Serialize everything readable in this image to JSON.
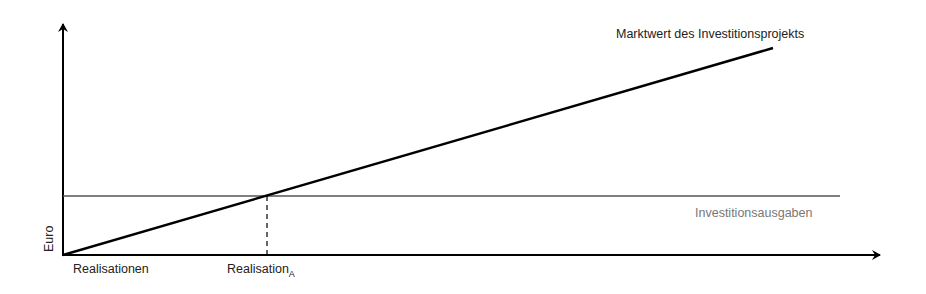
{
  "diagram": {
    "y_axis_label": "Euro",
    "x_axis_labels": {
      "origin": "Realisationen",
      "crossing_main": "Realisation",
      "crossing_sub": "A"
    },
    "lines": {
      "market_value": {
        "label": "Marktwert des Investitionsprojekts",
        "color": "#000000",
        "style": "solid"
      },
      "investment": {
        "label": "Investitionsausgaben",
        "color": "#555555",
        "style": "solid"
      },
      "crossing_marker": {
        "style": "dashed",
        "color": "#000000"
      }
    }
  }
}
